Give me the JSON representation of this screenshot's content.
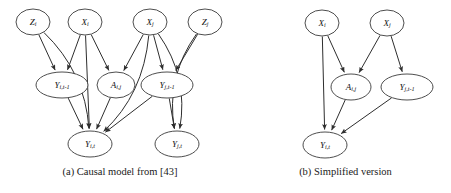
{
  "figure": {
    "type": "diagram",
    "subtype": "causal-dag",
    "width": 451,
    "height": 193,
    "background_color": "#ffffff",
    "node_stroke_color": "#3a3a3a",
    "edge_color": "#2e2e2e",
    "text_color": "#111111"
  },
  "panels": [
    {
      "id": "panel-a",
      "caption": "(a) Causal model from [43]",
      "nodes": [
        {
          "id": "Zi",
          "base": "Z",
          "sub": "i",
          "label": "Z_i",
          "x": 33,
          "y": 22,
          "rx": 17,
          "ry": 13
        },
        {
          "id": "Xi",
          "base": "X",
          "sub": "i",
          "label": "X_i",
          "x": 85,
          "y": 22,
          "rx": 17,
          "ry": 13
        },
        {
          "id": "Xj",
          "base": "X",
          "sub": "j",
          "label": "X_j",
          "x": 150,
          "y": 22,
          "rx": 17,
          "ry": 13
        },
        {
          "id": "Zj",
          "base": "Z",
          "sub": "j",
          "label": "Z_j",
          "x": 205,
          "y": 22,
          "rx": 17,
          "ry": 13
        },
        {
          "id": "Yit1",
          "base": "Y",
          "sub": "i,t-1",
          "label": "Y_{i,t-1}",
          "x": 62,
          "y": 85,
          "rx": 26,
          "ry": 13
        },
        {
          "id": "Aij",
          "base": "A",
          "sub": "i,j",
          "label": "A_{i,j}",
          "x": 116,
          "y": 85,
          "rx": 19,
          "ry": 13
        },
        {
          "id": "Yjt1",
          "base": "Y",
          "sub": "j,t-1",
          "label": "Y_{j,t-1}",
          "x": 167,
          "y": 85,
          "rx": 26,
          "ry": 13
        },
        {
          "id": "Yit",
          "base": "Y",
          "sub": "i,t",
          "label": "Y_{i,t}",
          "x": 90,
          "y": 144,
          "rx": 22,
          "ry": 13
        },
        {
          "id": "Yjt",
          "base": "Y",
          "sub": "j,t",
          "label": "Y_{j,t}",
          "x": 177,
          "y": 144,
          "rx": 22,
          "ry": 13
        }
      ],
      "edges": [
        {
          "from": "Zi",
          "to": "Yit1",
          "shape": "straight"
        },
        {
          "from": "Zi",
          "to": "Yit",
          "shape": "curve-left"
        },
        {
          "from": "Xi",
          "to": "Yit1",
          "shape": "straight"
        },
        {
          "from": "Xi",
          "to": "Aij",
          "shape": "straight"
        },
        {
          "from": "Xi",
          "to": "Yit",
          "shape": "straight"
        },
        {
          "from": "Xj",
          "to": "Aij",
          "shape": "straight"
        },
        {
          "from": "Xj",
          "to": "Yjt1",
          "shape": "straight"
        },
        {
          "from": "Xj",
          "to": "Yit",
          "shape": "curve-left"
        },
        {
          "from": "Xj",
          "to": "Yjt",
          "shape": "curve-left"
        },
        {
          "from": "Zj",
          "to": "Yjt1",
          "shape": "straight"
        },
        {
          "from": "Zj",
          "to": "Yjt",
          "shape": "curve-right"
        },
        {
          "from": "Yit1",
          "to": "Yit",
          "shape": "straight"
        },
        {
          "from": "Aij",
          "to": "Yit",
          "shape": "straight"
        },
        {
          "from": "Yjt1",
          "to": "Yit",
          "shape": "straight"
        },
        {
          "from": "Yjt1",
          "to": "Yjt",
          "shape": "straight"
        }
      ]
    },
    {
      "id": "panel-b",
      "caption": "(b) Simplified version",
      "nodes": [
        {
          "id": "bXi",
          "base": "X",
          "sub": "i",
          "label": "X_i",
          "x": 322,
          "y": 23,
          "rx": 17,
          "ry": 13
        },
        {
          "id": "bXj",
          "base": "X",
          "sub": "j",
          "label": "X_j",
          "x": 387,
          "y": 23,
          "rx": 17,
          "ry": 13
        },
        {
          "id": "bAij",
          "base": "A",
          "sub": "i,j",
          "label": "A_{i,j}",
          "x": 351,
          "y": 87,
          "rx": 20,
          "ry": 13
        },
        {
          "id": "bYjt1",
          "base": "Y",
          "sub": "j,t-1",
          "label": "Y_{j,t-1}",
          "x": 407,
          "y": 87,
          "rx": 26,
          "ry": 13
        },
        {
          "id": "bYit",
          "base": "Y",
          "sub": "i,t",
          "label": "Y_{i,t}",
          "x": 325,
          "y": 145,
          "rx": 22,
          "ry": 13
        }
      ],
      "edges": [
        {
          "from": "bXi",
          "to": "bAij",
          "shape": "straight"
        },
        {
          "from": "bXi",
          "to": "bYit",
          "shape": "straight"
        },
        {
          "from": "bXj",
          "to": "bAij",
          "shape": "straight"
        },
        {
          "from": "bXj",
          "to": "bYjt1",
          "shape": "straight"
        },
        {
          "from": "bAij",
          "to": "bYit",
          "shape": "straight"
        },
        {
          "from": "bYjt1",
          "to": "bYit",
          "shape": "straight"
        }
      ]
    }
  ]
}
